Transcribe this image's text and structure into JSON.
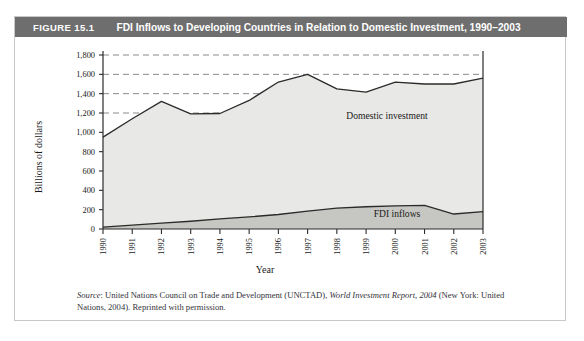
{
  "figure": {
    "number": "FIGURE 15.1",
    "title": "FDI Inflows to Developing Countries in Relation to Domestic Investment, 1990–2003"
  },
  "source": {
    "label": "Source",
    "separator": ": ",
    "text_before_title": "United Nations Council on Trade and Development (UNCTAD), ",
    "report_title": "World Investment Report, 2004",
    "text_after_title": " (New York: United Nations, 2004). Reprinted with permission."
  },
  "colors": {
    "header_bar": "#6e6e6e",
    "header_text": "#ffffff",
    "card_border": "#c9c9c9",
    "domestic_fill": "#e8e8e6",
    "fdi_fill": "#c6c6c2",
    "line": "#2b2b2b",
    "gridline": "#8a8a8a",
    "axis": "#2b2b2b"
  },
  "chart_data": {
    "type": "area",
    "title": "FDI Inflows to Developing Countries in Relation to Domestic Investment, 1990–2003",
    "xlabel": "Year",
    "ylabel": "Billions of dollars",
    "categories": [
      "1990",
      "1991",
      "1992",
      "1993",
      "1994",
      "1995",
      "1996",
      "1997",
      "1998",
      "1999",
      "2000",
      "2001",
      "2002",
      "2003"
    ],
    "ylim": [
      0,
      1800
    ],
    "yticks": [
      0,
      200,
      400,
      600,
      800,
      1000,
      1200,
      1400,
      1600,
      1800
    ],
    "ytick_labels": [
      "0",
      "200",
      "400",
      "600",
      "800",
      "1,000",
      "1,200",
      "1,400",
      "1,600",
      "1,800"
    ],
    "grid": "dashed horizontal gridlines at 1,200 / 1,400 / 1,600 / 1,800",
    "legend_position": "inline labels on areas",
    "stacked": false,
    "series": [
      {
        "name": "Domestic investment",
        "values": [
          950,
          1140,
          1320,
          1190,
          1195,
          1330,
          1520,
          1600,
          1450,
          1415,
          1520,
          1500,
          1500,
          1560
        ]
      },
      {
        "name": "FDI inflows",
        "values": [
          20,
          40,
          60,
          80,
          105,
          125,
          150,
          185,
          215,
          230,
          240,
          245,
          155,
          180
        ]
      }
    ]
  }
}
